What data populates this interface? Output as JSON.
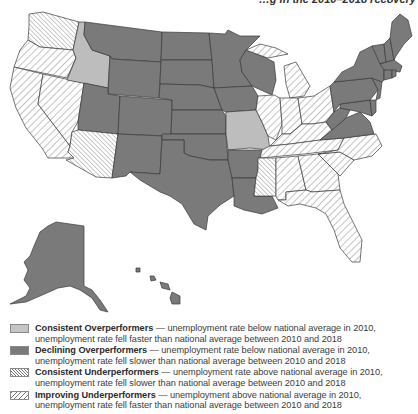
{
  "header": {
    "caption_fragment": "…g in the 2010–2018 recovery"
  },
  "map": {
    "colors": {
      "consistent_overperformer": "#bdbdbd",
      "declining_overperformer": "#7a7a7a",
      "hatch_stroke": "#6a6a6a",
      "border": "#3a3a3a"
    },
    "categories": {
      "consistent_overperformers": [
        "Idaho",
        "Missouri"
      ],
      "declining_overperformers": [
        "Montana",
        "Wyoming",
        "Utah",
        "Colorado",
        "New Mexico",
        "North Dakota",
        "South Dakota",
        "Nebraska",
        "Kansas",
        "Oklahoma",
        "Texas",
        "Minnesota",
        "Iowa",
        "Wisconsin",
        "Arkansas",
        "Louisiana",
        "New York",
        "Pennsylvania",
        "New Jersey",
        "Maryland",
        "Delaware",
        "Virginia",
        "West Virginia",
        "Maine",
        "New Hampshire",
        "Vermont",
        "Massachusetts",
        "Connecticut",
        "Rhode Island",
        "Alaska",
        "Hawaii"
      ],
      "consistent_underperformers": [
        "Washington",
        "Arizona",
        "Mississippi"
      ],
      "improving_underperformers": [
        "Oregon",
        "California",
        "Nevada",
        "Michigan",
        "Illinois",
        "Indiana",
        "Ohio",
        "Kentucky",
        "Tennessee",
        "North Carolina",
        "South Carolina",
        "Georgia",
        "Alabama",
        "Florida"
      ]
    }
  },
  "legend": {
    "items": [
      {
        "key": "consistent_overperformers",
        "title": "Consistent Overperformers",
        "description": " — unemployment rate below national average in 2010, unemployment rate fell faster than national average between 2010 and 2018",
        "pattern": "solid-light"
      },
      {
        "key": "declining_overperformers",
        "title": "Declining Overperformers",
        "description": " — unemployment rate below national average in 2010, unemployment rate fell slower than national average between 2010 and 2018",
        "pattern": "solid-dark"
      },
      {
        "key": "consistent_underperformers",
        "title": "Consistent Underperformers",
        "description": " — unemployment rate above national average in 2010, unemployment rate fell slower than national average between 2010 and 2018",
        "pattern": "hatch-backslash"
      },
      {
        "key": "improving_underperformers",
        "title": "Improving Underperformers",
        "description": " — unemployment above national average in 2010, unemployment rate fell faster than national average between 2010 and 2018",
        "pattern": "hatch-forwardslash"
      }
    ]
  }
}
